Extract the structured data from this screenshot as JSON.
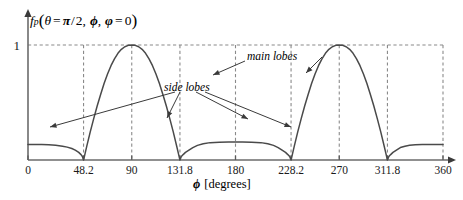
{
  "chart_data": {
    "type": "line",
    "title": "",
    "ylabel": "f_p(theta = pi/2, phi, varphi = 0)",
    "xlabel": "phi [degrees]",
    "xlim": [
      0,
      360
    ],
    "ylim": [
      0,
      1.08
    ],
    "grid": true,
    "legend": "none",
    "x_ticks": [
      "0",
      "48.2",
      "90",
      "131.8",
      "180",
      "228.2",
      "270",
      "311.8",
      "360"
    ],
    "x_tick_values": [
      0,
      48.2,
      90,
      131.8,
      180,
      228.2,
      270,
      311.8,
      360
    ],
    "y_ticks": [
      "1"
    ],
    "y_tick_values": [
      1
    ],
    "nulls": [
      48.2,
      131.8,
      228.2,
      311.8
    ],
    "main_lobe_peaks": [
      {
        "x": 90,
        "y": 1
      },
      {
        "x": 270,
        "y": 1
      }
    ],
    "side_lobe_peaks": [
      {
        "x": 0,
        "y": 0.135
      },
      {
        "x": 180,
        "y": 0.155
      },
      {
        "x": 360,
        "y": 0.135
      }
    ],
    "series": [
      {
        "name": "f_p",
        "points": [
          [
            0,
            0.135
          ],
          [
            6,
            0.135
          ],
          [
            12,
            0.134
          ],
          [
            18,
            0.132
          ],
          [
            24,
            0.128
          ],
          [
            30,
            0.12
          ],
          [
            34,
            0.112
          ],
          [
            38,
            0.1
          ],
          [
            41,
            0.086
          ],
          [
            44,
            0.066
          ],
          [
            46,
            0.047
          ],
          [
            47.2,
            0.03
          ],
          [
            48.2,
            0.0
          ],
          [
            49.5,
            0.055
          ],
          [
            51,
            0.12
          ],
          [
            54,
            0.245
          ],
          [
            57,
            0.36
          ],
          [
            60,
            0.47
          ],
          [
            63,
            0.57
          ],
          [
            66,
            0.665
          ],
          [
            69,
            0.748
          ],
          [
            72,
            0.82
          ],
          [
            75,
            0.88
          ],
          [
            78,
            0.928
          ],
          [
            81,
            0.962
          ],
          [
            84,
            0.985
          ],
          [
            87,
            0.997
          ],
          [
            90,
            1.0
          ],
          [
            93,
            0.997
          ],
          [
            96,
            0.985
          ],
          [
            99,
            0.962
          ],
          [
            102,
            0.928
          ],
          [
            105,
            0.88
          ],
          [
            108,
            0.82
          ],
          [
            111,
            0.748
          ],
          [
            114,
            0.665
          ],
          [
            117,
            0.57
          ],
          [
            120,
            0.47
          ],
          [
            123,
            0.36
          ],
          [
            126,
            0.245
          ],
          [
            129,
            0.12
          ],
          [
            130.5,
            0.055
          ],
          [
            131.8,
            0.0
          ],
          [
            133,
            0.03
          ],
          [
            134.6,
            0.047
          ],
          [
            136.6,
            0.066
          ],
          [
            139.6,
            0.086
          ],
          [
            143,
            0.108
          ],
          [
            147,
            0.127
          ],
          [
            152,
            0.142
          ],
          [
            158,
            0.151
          ],
          [
            166,
            0.155
          ],
          [
            174,
            0.156
          ],
          [
            180,
            0.156
          ],
          [
            186,
            0.156
          ],
          [
            194,
            0.155
          ],
          [
            202,
            0.151
          ],
          [
            208,
            0.142
          ],
          [
            213,
            0.127
          ],
          [
            217,
            0.108
          ],
          [
            220.4,
            0.086
          ],
          [
            223.4,
            0.066
          ],
          [
            225.4,
            0.047
          ],
          [
            227,
            0.03
          ],
          [
            228.2,
            0.0
          ],
          [
            229.5,
            0.055
          ],
          [
            231,
            0.12
          ],
          [
            234,
            0.245
          ],
          [
            237,
            0.36
          ],
          [
            240,
            0.47
          ],
          [
            243,
            0.57
          ],
          [
            246,
            0.665
          ],
          [
            249,
            0.748
          ],
          [
            252,
            0.82
          ],
          [
            255,
            0.88
          ],
          [
            258,
            0.928
          ],
          [
            261,
            0.962
          ],
          [
            264,
            0.985
          ],
          [
            267,
            0.997
          ],
          [
            270,
            1.0
          ],
          [
            273,
            0.997
          ],
          [
            276,
            0.985
          ],
          [
            279,
            0.962
          ],
          [
            282,
            0.928
          ],
          [
            285,
            0.88
          ],
          [
            288,
            0.82
          ],
          [
            291,
            0.748
          ],
          [
            294,
            0.665
          ],
          [
            297,
            0.57
          ],
          [
            300,
            0.47
          ],
          [
            303,
            0.36
          ],
          [
            306,
            0.245
          ],
          [
            309,
            0.12
          ],
          [
            310.5,
            0.055
          ],
          [
            311.8,
            0.0
          ],
          [
            313,
            0.03
          ],
          [
            314.6,
            0.047
          ],
          [
            316.6,
            0.066
          ],
          [
            319.6,
            0.086
          ],
          [
            323,
            0.108
          ],
          [
            327,
            0.12
          ],
          [
            331,
            0.128
          ],
          [
            336,
            0.132
          ],
          [
            342,
            0.134
          ],
          [
            348,
            0.135
          ],
          [
            354,
            0.135
          ],
          [
            360,
            0.135
          ]
        ]
      }
    ],
    "annotations": [
      {
        "label": "main lobes",
        "text": "main lobes"
      },
      {
        "label": "side lobes",
        "text": "side lobes"
      }
    ]
  },
  "axis": {
    "y_one_label": "1",
    "x_title_symbol": "ϕ",
    "x_title_units": "[degrees]"
  },
  "ylabel_parts": {
    "f": "f",
    "p": "p",
    "open": "(",
    "theta": "θ",
    "eq1": "=",
    "pi": "π",
    "slash": "/",
    "two": "2",
    "comma1": ",",
    "phi": "ϕ",
    "comma2": ",",
    "varphi": "φ",
    "eq2": "=",
    "zero": "0",
    "close": ")"
  },
  "annotations": {
    "main_lobes": "main lobes",
    "side_lobes": "side lobes"
  },
  "ticks": [
    {
      "label": "0",
      "value": 0
    },
    {
      "label": "48.2",
      "value": 48.2
    },
    {
      "label": "90",
      "value": 90
    },
    {
      "label": "131.8",
      "value": 131.8
    },
    {
      "label": "180",
      "value": 180
    },
    {
      "label": "228.2",
      "value": 228.2
    },
    {
      "label": "270",
      "value": 270
    },
    {
      "label": "311.8",
      "value": 311.8
    },
    {
      "label": "360",
      "value": 360
    }
  ],
  "colors": {
    "curve": "#4a4a4a",
    "axis": "#6b6b6b",
    "grid": "#8a8a8a",
    "text": "#1a1a1a",
    "background": "#ffffff"
  }
}
